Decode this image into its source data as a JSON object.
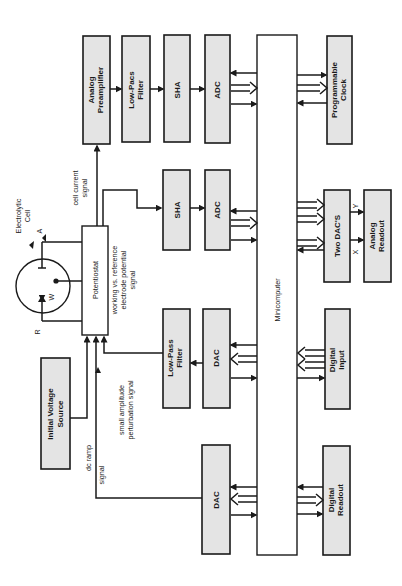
{
  "diagram": {
    "orientation": "rotated 90 degrees counter-clockwise (text reads bottom-to-top)",
    "blocks": {
      "analog_preamplifier": {
        "line1": "Analog",
        "line2": "Preamplifier"
      },
      "low_pass_filter_top": {
        "line1": "Low-Pacs",
        "line2": "Filter"
      },
      "sha_top": {
        "label": "SHA"
      },
      "adc_top": {
        "label": "ADC"
      },
      "programmable_clock": {
        "line1": "Programmable",
        "line2": "Clock"
      },
      "sha_mid": {
        "label": "SHA"
      },
      "adc_mid": {
        "label": "ADC"
      },
      "two_dacs": {
        "label": "Two DAC'S"
      },
      "analog_readout": {
        "line1": "Analog",
        "line2": "Readout"
      },
      "potentiostat": {
        "label": "Potentiostat"
      },
      "low_pass_filter_mid": {
        "line1": "Low-Pass",
        "line2": "Filter"
      },
      "dac_mid": {
        "label": "DAC"
      },
      "digital_input": {
        "line1": "Digital",
        "line2": "Input"
      },
      "initial_voltage_source": {
        "line1": "Initial Voltage",
        "line2": "Source"
      },
      "dac_bottom": {
        "label": "DAC"
      },
      "digital_readout": {
        "line1": "Digital",
        "line2": "Readout"
      },
      "minicomputer": {
        "label": "Minicomputer"
      }
    },
    "cell": {
      "title_line1": "Electrolytic",
      "title_line2": "Cell",
      "electrode_a": "A",
      "electrode_w": "W",
      "electrode_r": "R"
    },
    "signals": {
      "cell_current_line1": "cell current",
      "cell_current_line2": "signal",
      "working_ref_line1": "working vs. reference",
      "working_ref_line2": "electrode potential",
      "working_ref_line3": "signal",
      "perturbation_line1": "small amplitude",
      "perturbation_line2": "perturbation signal",
      "dc_ramp_line1": "dc ramp",
      "dc_ramp_line2": "signal",
      "x_axis": "X",
      "y_axis": "Y"
    }
  }
}
